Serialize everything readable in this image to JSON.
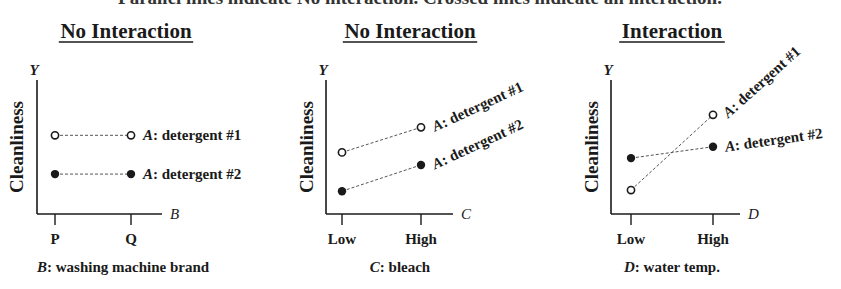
{
  "figure_title": "Parallel lines indicate No interaction. Crossed lines indicate an interaction.",
  "panels": [
    {
      "title": "No Interaction",
      "y_letter": "Y",
      "y_label": "Cleanliness",
      "x_letter": "B",
      "x_ticks": [
        "P",
        "Q"
      ],
      "caption_var": "B",
      "caption_text": ": washing machine brand",
      "series": [
        {
          "name": "A: detergent #1",
          "marker": "open",
          "values": [
            0.62,
            0.62
          ]
        },
        {
          "name": "A: detergent #2",
          "marker": "filled",
          "values": [
            0.28,
            0.28
          ]
        }
      ]
    },
    {
      "title": "No Interaction",
      "y_letter": "Y",
      "y_label": "Cleanliness",
      "x_letter": "C",
      "x_ticks": [
        "Low",
        "High"
      ],
      "caption_var": "C",
      "caption_text": ": bleach",
      "series": [
        {
          "name": "A: detergent #1",
          "marker": "open",
          "values": [
            0.47,
            0.69
          ]
        },
        {
          "name": "A: detergent #2",
          "marker": "filled",
          "values": [
            0.13,
            0.36
          ]
        }
      ]
    },
    {
      "title": "Interaction",
      "y_letter": "Y",
      "y_label": "Cleanliness",
      "x_letter": "D",
      "x_ticks": [
        "Low",
        "High"
      ],
      "caption_var": "D",
      "caption_text": ": water temp.",
      "series": [
        {
          "name": "A: detergent #1",
          "marker": "open",
          "values": [
            0.14,
            0.8
          ]
        },
        {
          "name": "A: detergent #2",
          "marker": "filled",
          "values": [
            0.42,
            0.52
          ]
        }
      ]
    }
  ],
  "chart_data": [
    {
      "type": "line",
      "title": "No Interaction",
      "xlabel": "B: washing machine brand",
      "ylabel": "Cleanliness",
      "categories": [
        "P",
        "Q"
      ],
      "series": [
        {
          "name": "A: detergent #1",
          "values": [
            0.62,
            0.62
          ]
        },
        {
          "name": "A: detergent #2",
          "values": [
            0.28,
            0.28
          ]
        }
      ],
      "ylim": [
        0,
        1
      ],
      "grid": false
    },
    {
      "type": "line",
      "title": "No Interaction",
      "xlabel": "C: bleach",
      "ylabel": "Cleanliness",
      "categories": [
        "Low",
        "High"
      ],
      "series": [
        {
          "name": "A: detergent #1",
          "values": [
            0.47,
            0.69
          ]
        },
        {
          "name": "A: detergent #2",
          "values": [
            0.13,
            0.36
          ]
        }
      ],
      "ylim": [
        0,
        1
      ],
      "grid": false
    },
    {
      "type": "line",
      "title": "Interaction",
      "xlabel": "D: water temp.",
      "ylabel": "Cleanliness",
      "categories": [
        "Low",
        "High"
      ],
      "series": [
        {
          "name": "A: detergent #1",
          "values": [
            0.14,
            0.8
          ]
        },
        {
          "name": "A: detergent #2",
          "values": [
            0.42,
            0.52
          ]
        }
      ],
      "ylim": [
        0,
        1
      ],
      "grid": false
    }
  ]
}
